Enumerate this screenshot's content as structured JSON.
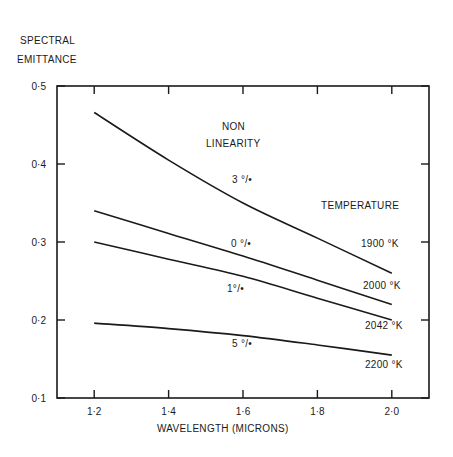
{
  "chart_data": {
    "type": "line",
    "title": "",
    "ylabel": "SPECTRAL EMITTANCE",
    "ylabel_lines": [
      "SPECTRAL",
      "EMITTANCE"
    ],
    "xlabel": "WAVELENGTH  (MICRONS)",
    "xlim": [
      1.1,
      2.1
    ],
    "ylim": [
      0.1,
      0.5
    ],
    "x_ticks": [
      1.2,
      1.4,
      1.6,
      1.8,
      2.0
    ],
    "x_tick_labels": [
      "1·2",
      "1·4",
      "1·6",
      "1·8",
      "2·0"
    ],
    "y_ticks": [
      0.1,
      0.2,
      0.3,
      0.4,
      0.5
    ],
    "y_tick_labels": [
      "0·1",
      "0·2",
      "0·3",
      "0·4",
      "0·5"
    ],
    "grid": false,
    "annotations": {
      "nonlinearity_header": [
        "NON",
        "LINEARITY"
      ],
      "temperature_header": "TEMPERATURE"
    },
    "x": [
      1.2,
      1.4,
      1.6,
      1.8,
      2.0
    ],
    "series": [
      {
        "name": "1900 °K",
        "nonlinearity": "3 °/•",
        "values": [
          0.466,
          0.405,
          0.35,
          0.305,
          0.26
        ]
      },
      {
        "name": "2000 °K",
        "nonlinearity": "0 °/•",
        "values": [
          0.34,
          0.311,
          0.282,
          0.251,
          0.22
        ]
      },
      {
        "name": "2042 °K",
        "nonlinearity": "1°/•",
        "values": [
          0.3,
          0.278,
          0.256,
          0.228,
          0.2
        ]
      },
      {
        "name": "2200 °K",
        "nonlinearity": "5 °/•",
        "values": [
          0.196,
          0.189,
          0.18,
          0.168,
          0.155
        ]
      }
    ]
  }
}
